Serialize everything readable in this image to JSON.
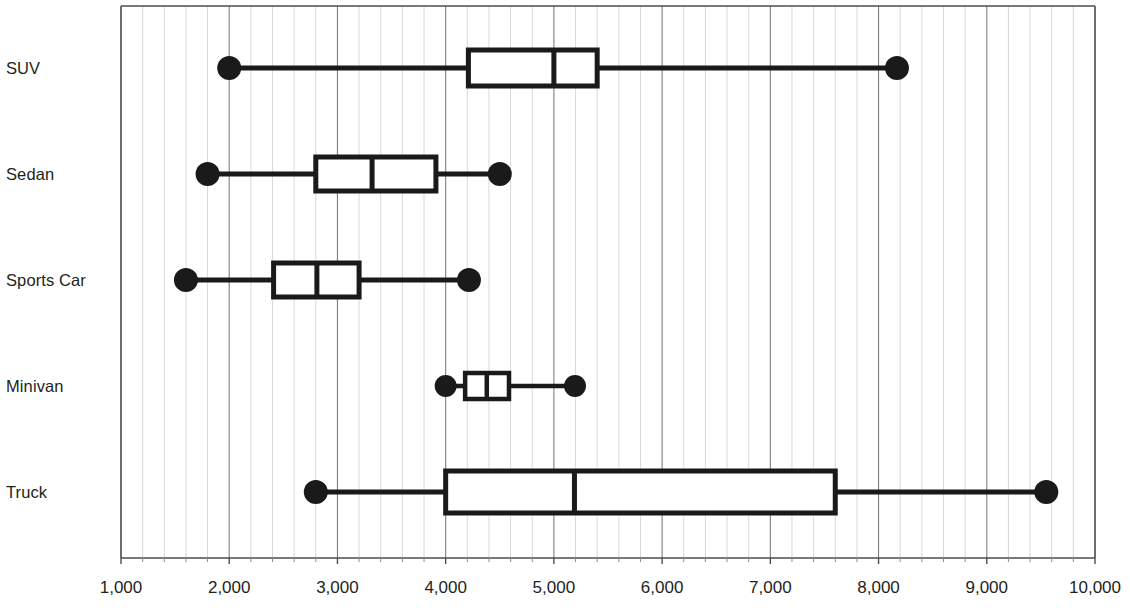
{
  "chart_data": {
    "type": "box",
    "orientation": "horizontal",
    "title": "",
    "xlabel": "",
    "ylabel": "",
    "xlim": [
      1000,
      10000
    ],
    "xticks": [
      1000,
      2000,
      3000,
      4000,
      5000,
      6000,
      7000,
      8000,
      9000,
      10000
    ],
    "xtick_labels": [
      "1,000",
      "2,000",
      "3,000",
      "4,000",
      "5,000",
      "6,000",
      "7,000",
      "8,000",
      "9,000",
      "10,000"
    ],
    "minor_tick_step": 200,
    "grid": true,
    "grid_major_color": "#7f7f7f",
    "grid_minor_color": "#d9d9d9",
    "legend": null,
    "categories": [
      "SUV",
      "Sedan",
      "Sports Car",
      "Minivan",
      "Truck"
    ],
    "series_color": "#1a1a1a",
    "boxes": [
      {
        "category": "SUV",
        "min": 2000,
        "q1": 4210,
        "median": 5000,
        "q3": 5400,
        "max": 8170
      },
      {
        "category": "Sedan",
        "min": 1800,
        "q1": 2800,
        "median": 3320,
        "q3": 3910,
        "max": 4500
      },
      {
        "category": "Sports Car",
        "min": 1600,
        "q1": 2410,
        "median": 2810,
        "q3": 3200,
        "max": 4215
      },
      {
        "category": "Minivan",
        "min": 4000,
        "q1": 4180,
        "median": 4380,
        "q3": 4585,
        "max": 5195
      },
      {
        "category": "Truck",
        "min": 2800,
        "q1": 4000,
        "median": 5190,
        "q3": 7600,
        "max": 9550
      }
    ]
  }
}
